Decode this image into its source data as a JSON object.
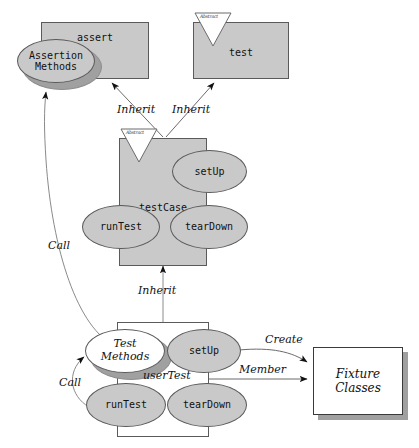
{
  "diagram": {
    "colors": {
      "node_fill": "#c9c9c9",
      "node_fill_white": "#ffffff",
      "stroke": "#5a5a5a",
      "shadow": "#a0a0a0",
      "text": "#111111",
      "edge": "#555555"
    },
    "nodes": {
      "assert_class": {
        "label": "assert",
        "kind": "class-box",
        "fill": "#c9c9c9"
      },
      "assertion_methods": {
        "label": "Assertion\nMethods",
        "kind": "ellipse",
        "fill": "#c9c9c9"
      },
      "test_class": {
        "label": "test",
        "kind": "class-box",
        "fill": "#c9c9c9",
        "stereotype": "Abstract"
      },
      "testcase_class": {
        "label": "testCase",
        "kind": "class-box",
        "fill": "#c9c9c9",
        "stereotype": "Abstract"
      },
      "testcase_setup": {
        "label": "setUp",
        "kind": "ellipse",
        "fill": "#c9c9c9"
      },
      "testcase_runtest": {
        "label": "runTest",
        "kind": "ellipse",
        "fill": "#c9c9c9"
      },
      "testcase_teardown": {
        "label": "tearDown",
        "kind": "ellipse",
        "fill": "#c9c9c9"
      },
      "usertest_class": {
        "label": "userTest",
        "kind": "class-box",
        "fill": "#ffffff"
      },
      "usertest_testmethods": {
        "label": "Test\nMethods",
        "kind": "ellipse",
        "fill": "#ffffff"
      },
      "usertest_setup": {
        "label": "setUp",
        "kind": "ellipse",
        "fill": "#c9c9c9"
      },
      "usertest_runtest": {
        "label": "runTest",
        "kind": "ellipse",
        "fill": "#c9c9c9"
      },
      "usertest_teardown": {
        "label": "tearDown",
        "kind": "ellipse",
        "fill": "#c9c9c9"
      },
      "fixture_classes": {
        "label": "Fixture\nClasses",
        "kind": "class-box",
        "fill": "#ffffff"
      }
    },
    "edges": [
      {
        "id": "e1",
        "label": "Inherit",
        "from": "testcase_class",
        "to": "assert_class"
      },
      {
        "id": "e2",
        "label": "Inherit",
        "from": "testcase_class",
        "to": "test_class"
      },
      {
        "id": "e3",
        "label": "Inherit",
        "from": "usertest_class",
        "to": "testcase_class"
      },
      {
        "id": "e4",
        "label": "Call",
        "from": "usertest_testmethods",
        "to": "assertion_methods"
      },
      {
        "id": "e5",
        "label": "Call",
        "from": "usertest_runtest",
        "to": "usertest_testmethods"
      },
      {
        "id": "e6",
        "label": "Create",
        "from": "usertest_setup",
        "to": "fixture_classes"
      },
      {
        "id": "e7",
        "label": "Member",
        "from": "usertest_class",
        "to": "fixture_classes"
      }
    ],
    "stereotype_tag": "Abstract"
  }
}
